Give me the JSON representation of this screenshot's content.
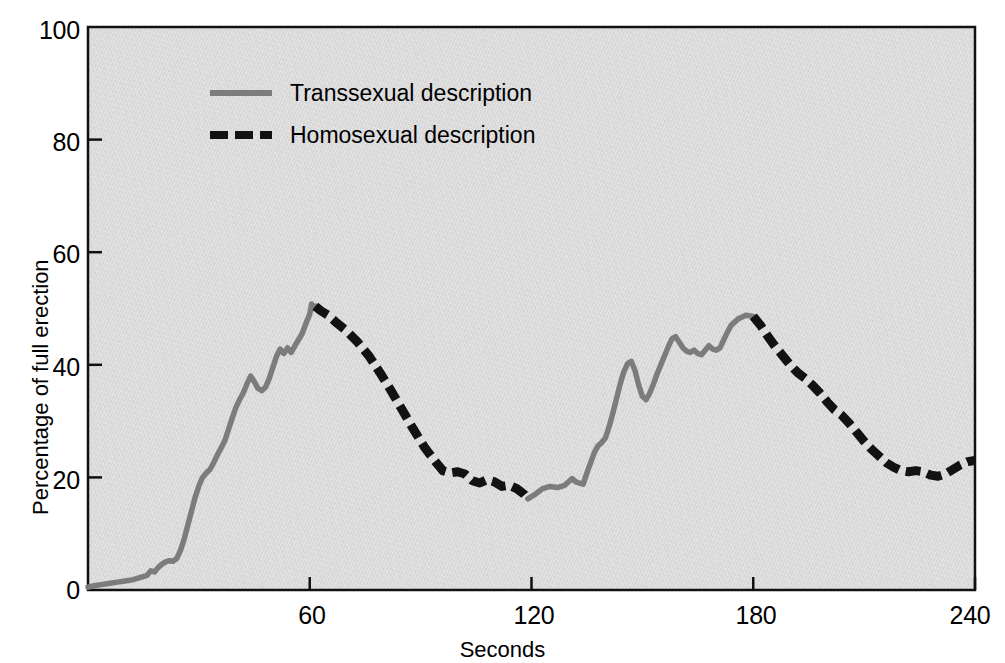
{
  "chart_data": {
    "type": "line",
    "title": "",
    "xlabel": "Seconds",
    "ylabel": "Percentage of full erection",
    "xlim": [
      0,
      240
    ],
    "ylim": [
      0,
      100
    ],
    "xticks": [
      60,
      120,
      180,
      240
    ],
    "yticks": [
      0,
      20,
      40,
      60,
      80,
      100
    ],
    "grid": false,
    "legend_position": "upper-left-inside",
    "legend": [
      {
        "label": "Transsexual description",
        "style": "solid",
        "color": "#7c7c7c"
      },
      {
        "label": "Homosexual description",
        "style": "dashed",
        "color": "#121212"
      }
    ],
    "series": [
      {
        "name": "Transsexual description",
        "style": "solid",
        "color": "#7c7c7c",
        "points": [
          [
            0,
            0.5
          ],
          [
            2,
            0.8
          ],
          [
            4,
            1.0
          ],
          [
            6,
            1.2
          ],
          [
            8,
            1.4
          ],
          [
            10,
            1.6
          ],
          [
            12,
            1.8
          ],
          [
            14,
            2.2
          ],
          [
            16,
            2.6
          ],
          [
            17,
            3.4
          ],
          [
            18,
            3.2
          ],
          [
            19,
            4.0
          ],
          [
            20,
            4.6
          ],
          [
            21,
            5.0
          ],
          [
            22,
            5.2
          ],
          [
            23,
            5.1
          ],
          [
            24,
            5.6
          ],
          [
            25,
            7.0
          ],
          [
            26,
            9.0
          ],
          [
            27,
            11.5
          ],
          [
            28,
            14.0
          ],
          [
            29,
            16.5
          ],
          [
            30,
            18.5
          ],
          [
            31,
            20.0
          ],
          [
            32,
            20.8
          ],
          [
            33,
            21.4
          ],
          [
            34,
            22.6
          ],
          [
            35,
            24.0
          ],
          [
            36,
            25.2
          ],
          [
            37,
            26.5
          ],
          [
            38,
            28.5
          ],
          [
            39,
            30.5
          ],
          [
            40,
            32.4
          ],
          [
            41,
            33.8
          ],
          [
            42,
            35.0
          ],
          [
            43,
            36.6
          ],
          [
            44,
            38.0
          ],
          [
            45,
            37.0
          ],
          [
            46,
            35.8
          ],
          [
            47,
            35.4
          ],
          [
            48,
            36.0
          ],
          [
            49,
            37.5
          ],
          [
            50,
            39.5
          ],
          [
            51,
            41.5
          ],
          [
            52,
            42.8
          ],
          [
            53,
            42.0
          ],
          [
            54,
            43.0
          ],
          [
            55,
            42.2
          ],
          [
            56,
            43.4
          ],
          [
            57,
            44.5
          ],
          [
            58,
            45.6
          ],
          [
            59,
            47.4
          ],
          [
            60,
            49.0
          ],
          [
            60.5,
            50.8
          ],
          [
            61,
            50.0
          ],
          [
            61.5,
            50.4
          ]
        ]
      },
      {
        "name": "Homosexual description",
        "style": "dashed",
        "color": "#121212",
        "points": [
          [
            61.5,
            50.4
          ],
          [
            63,
            49.6
          ],
          [
            65,
            48.8
          ],
          [
            67,
            47.6
          ],
          [
            70,
            46.0
          ],
          [
            73,
            44.0
          ],
          [
            76,
            41.6
          ],
          [
            79,
            38.6
          ],
          [
            82,
            35.4
          ],
          [
            85,
            32.0
          ],
          [
            88,
            28.6
          ],
          [
            91,
            25.4
          ],
          [
            94,
            22.8
          ],
          [
            96,
            21.2
          ],
          [
            98,
            20.8
          ],
          [
            100,
            21.0
          ],
          [
            102,
            20.6
          ],
          [
            104,
            19.4
          ],
          [
            106,
            19.0
          ],
          [
            108,
            19.6
          ],
          [
            110,
            19.2
          ],
          [
            112,
            18.4
          ],
          [
            114,
            18.6
          ],
          [
            116,
            18.0
          ],
          [
            118,
            17.0
          ],
          [
            119,
            16.2
          ]
        ]
      },
      {
        "name": "Transsexual description",
        "style": "solid",
        "color": "#7c7c7c",
        "points": [
          [
            119,
            16.2
          ],
          [
            121,
            17.0
          ],
          [
            123,
            18.0
          ],
          [
            125,
            18.4
          ],
          [
            127,
            18.2
          ],
          [
            129,
            18.6
          ],
          [
            131,
            19.8
          ],
          [
            132,
            19.2
          ],
          [
            133,
            19.0
          ],
          [
            134,
            18.8
          ],
          [
            135,
            20.8
          ],
          [
            136,
            22.6
          ],
          [
            137,
            24.4
          ],
          [
            138,
            25.6
          ],
          [
            139,
            26.2
          ],
          [
            140,
            27.0
          ],
          [
            141,
            29.0
          ],
          [
            142,
            31.4
          ],
          [
            143,
            34.0
          ],
          [
            144,
            36.6
          ],
          [
            145,
            38.8
          ],
          [
            146,
            40.2
          ],
          [
            147,
            40.6
          ],
          [
            148,
            39.0
          ],
          [
            149,
            36.4
          ],
          [
            150,
            34.4
          ],
          [
            151,
            33.8
          ],
          [
            152,
            35.0
          ],
          [
            153,
            36.6
          ],
          [
            154,
            38.4
          ],
          [
            155,
            40.0
          ],
          [
            156,
            41.6
          ],
          [
            157,
            43.2
          ],
          [
            158,
            44.6
          ],
          [
            159,
            45.0
          ],
          [
            160,
            44.0
          ],
          [
            161,
            43.0
          ],
          [
            162,
            42.4
          ],
          [
            163,
            42.2
          ],
          [
            164,
            42.6
          ],
          [
            165,
            42.0
          ],
          [
            166,
            41.8
          ],
          [
            167,
            42.6
          ],
          [
            168,
            43.4
          ],
          [
            169,
            42.8
          ],
          [
            170,
            42.6
          ],
          [
            171,
            43.0
          ],
          [
            172,
            44.4
          ],
          [
            173,
            45.8
          ],
          [
            174,
            47.0
          ],
          [
            176,
            48.2
          ],
          [
            178,
            48.8
          ],
          [
            180,
            48.6
          ]
        ]
      },
      {
        "name": "Homosexual description",
        "style": "dashed",
        "color": "#121212",
        "points": [
          [
            180,
            48.6
          ],
          [
            182,
            47.0
          ],
          [
            184,
            45.0
          ],
          [
            186,
            43.2
          ],
          [
            188,
            41.6
          ],
          [
            190,
            40.0
          ],
          [
            192,
            38.6
          ],
          [
            194,
            37.6
          ],
          [
            196,
            36.4
          ],
          [
            198,
            35.0
          ],
          [
            200,
            33.4
          ],
          [
            202,
            32.0
          ],
          [
            204,
            31.0
          ],
          [
            206,
            29.6
          ],
          [
            208,
            28.0
          ],
          [
            210,
            26.4
          ],
          [
            212,
            25.0
          ],
          [
            214,
            23.8
          ],
          [
            216,
            22.6
          ],
          [
            218,
            21.8
          ],
          [
            220,
            21.2
          ],
          [
            222,
            21.0
          ],
          [
            224,
            21.2
          ],
          [
            226,
            21.0
          ],
          [
            228,
            20.4
          ],
          [
            230,
            20.2
          ],
          [
            232,
            20.6
          ],
          [
            234,
            21.4
          ],
          [
            236,
            22.2
          ],
          [
            238,
            22.8
          ],
          [
            240,
            23.0
          ]
        ]
      }
    ]
  },
  "axes": {
    "y_tick_labels": [
      "100",
      "80",
      "60",
      "40",
      "20",
      "0"
    ],
    "x_tick_labels": [
      "60",
      "120",
      "180",
      "240"
    ],
    "y_axis_title": "Percentage of full erection",
    "x_axis_title": "Seconds"
  },
  "colors": {
    "plot_background": "#d9d9d9",
    "axis": "#000000",
    "transsexual_line": "#7c7c7c",
    "homosexual_line": "#121212"
  }
}
